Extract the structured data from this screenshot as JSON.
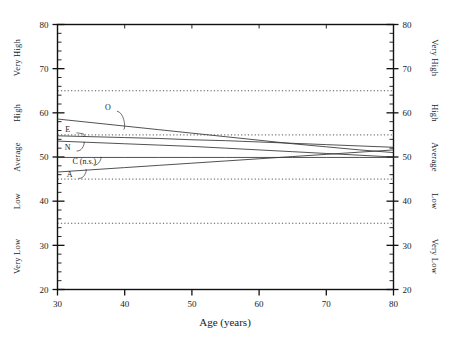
{
  "chart_data": {
    "type": "line",
    "title": "",
    "xlabel": "Age  (years)",
    "ylabel": "",
    "xlim": [
      30,
      80
    ],
    "ylim": [
      20,
      80
    ],
    "x_ticks": [
      30,
      40,
      50,
      60,
      70,
      80
    ],
    "y_ticks": [
      20,
      30,
      40,
      50,
      60,
      70,
      80
    ],
    "x_minor_step": 2,
    "y_minor_step": 2,
    "grid": false,
    "legend_position": "inline-labels",
    "reference_lines": {
      "values": [
        65,
        55,
        45,
        35
      ],
      "style": "dotted",
      "note": "category boundaries"
    },
    "category_bands": [
      {
        "label": "Very High",
        "from": 65,
        "to": 80
      },
      {
        "label": "High",
        "from": 55,
        "to": 65
      },
      {
        "label": "Average",
        "from": 45,
        "to": 55
      },
      {
        "label": "Low",
        "from": 35,
        "to": 45
      },
      {
        "label": "Very Low",
        "from": 20,
        "to": 35
      }
    ],
    "left_axis_categories": [
      "Very High",
      "High",
      "Average",
      "Low",
      "Very Low"
    ],
    "right_axis_categories": [
      "Very High",
      "High",
      "Average",
      "Low",
      "Very Low"
    ],
    "x": [
      30,
      35,
      40,
      45,
      50,
      55,
      60,
      65,
      70,
      75,
      80
    ],
    "series": [
      {
        "name": "O",
        "label": "O",
        "values": [
          58.6,
          57.8,
          57.0,
          56.2,
          55.4,
          54.6,
          53.8,
          53.0,
          52.3,
          51.6,
          51.0
        ]
      },
      {
        "name": "E",
        "label": "E",
        "values": [
          54.8,
          54.6,
          54.4,
          54.2,
          53.9,
          53.7,
          53.4,
          53.1,
          52.8,
          52.5,
          52.2
        ]
      },
      {
        "name": "N",
        "label": "N",
        "values": [
          53.6,
          53.3,
          53.0,
          52.7,
          52.4,
          52.0,
          51.6,
          51.2,
          50.8,
          50.4,
          50.0
        ]
      },
      {
        "name": "C (n.s.)",
        "label": "C (n.s.)",
        "values": [
          49.9,
          49.9,
          49.9,
          49.9,
          49.9,
          49.9,
          49.9,
          49.9,
          49.9,
          49.9,
          49.9
        ]
      },
      {
        "name": "A",
        "label": "A",
        "values": [
          46.6,
          47.1,
          47.6,
          48.1,
          48.6,
          49.1,
          49.6,
          50.1,
          50.6,
          51.1,
          51.6
        ]
      }
    ],
    "series_annotations": [
      {
        "name": "O",
        "label_x": 37.5,
        "label_value": 60.6
      },
      {
        "name": "E",
        "label_x": 31.5,
        "label_value": 55.7
      },
      {
        "name": "N",
        "label_x": 31.5,
        "label_value": 51.6
      },
      {
        "name": "C (n.s.)",
        "label_x": 34.0,
        "label_value": 48.4
      },
      {
        "name": "A",
        "label_x": 31.8,
        "label_value": 45.4
      }
    ]
  }
}
